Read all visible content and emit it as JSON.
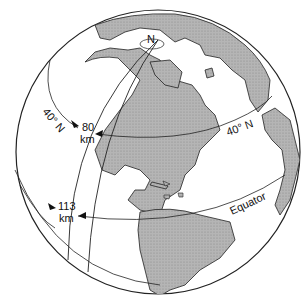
{
  "diagram": {
    "labels": {
      "pole": "N",
      "lat_left": "40° N",
      "lat_right": "40° N",
      "dist_40": "80",
      "dist_40_unit": "km",
      "dist_eq": "113",
      "dist_eq_unit": "km",
      "equator": "Equator"
    },
    "measurements": [
      {
        "latitude": "40° N",
        "distance": "80 km"
      },
      {
        "latitude": "Equator",
        "distance": "113 km"
      }
    ],
    "colors": {
      "land": "#a8a8a8",
      "ocean": "#ffffff",
      "outline": "#222222"
    }
  }
}
